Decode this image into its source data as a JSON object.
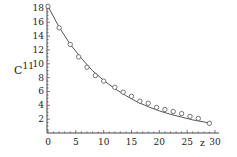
{
  "chart_data": {
    "type": "scatter+line",
    "title": "",
    "xlabel": "z",
    "ylabel": "C11",
    "ylabel_display": {
      "base": "C",
      "superscript": "11"
    },
    "xlim": [
      0,
      30
    ],
    "ylim": [
      0,
      18.5
    ],
    "x_ticks": [
      0,
      5,
      10,
      15,
      20,
      25,
      30
    ],
    "y_ticks": [
      2,
      4,
      6,
      8,
      10,
      12,
      14,
      16,
      18
    ],
    "grid": false,
    "legend": null,
    "series": [
      {
        "name": "data",
        "type": "scatter",
        "marker": "open-circle",
        "x": [
          0,
          2,
          4,
          5.5,
          7,
          8.5,
          10,
          12,
          13.5,
          15,
          16.5,
          18,
          19.5,
          21,
          22.5,
          24,
          25.5,
          27,
          29
        ],
        "y": [
          18.3,
          15.2,
          12.8,
          11.0,
          9.5,
          8.3,
          7.5,
          6.6,
          5.9,
          5.3,
          4.6,
          4.3,
          3.7,
          3.4,
          3.1,
          2.8,
          2.4,
          2.1,
          1.4
        ]
      },
      {
        "name": "fit",
        "type": "line",
        "x": [
          0,
          2,
          4,
          6,
          8,
          10,
          12,
          14,
          16,
          18,
          20,
          22,
          24,
          26,
          28,
          29
        ],
        "y": [
          18.3,
          15.3,
          12.8,
          10.8,
          9.0,
          7.6,
          6.4,
          5.4,
          4.5,
          3.8,
          3.2,
          2.7,
          2.3,
          1.9,
          1.6,
          1.4
        ]
      }
    ]
  },
  "colors": {
    "axis": "#444444",
    "line": "#555555",
    "marker": "#555555"
  }
}
